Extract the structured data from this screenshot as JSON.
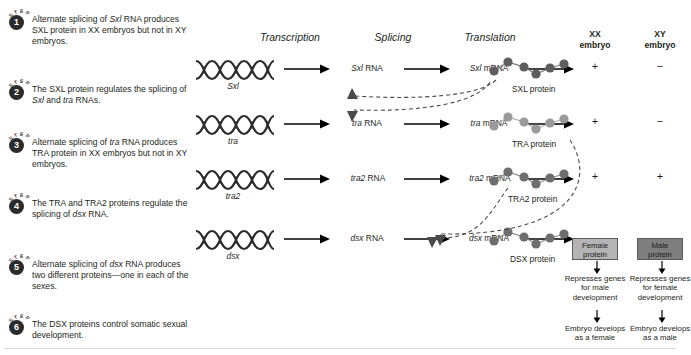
{
  "steps": [
    {
      "badge_word": "STEP",
      "number": "1",
      "text": "Alternate splicing of Sxl RNA produces SXL protein in XX embryos but not in XY embryos.",
      "italic_terms": [
        "Sxl"
      ]
    },
    {
      "badge_word": "STEP",
      "number": "2",
      "text": "The SXL protein regulates the splicing of Sxl and tra RNAs.",
      "italic_terms": [
        "Sxl",
        "tra"
      ]
    },
    {
      "badge_word": "STEP",
      "number": "3",
      "text": "Alternate splicing of tra RNA produces TRA protein in XX embryos but not in XY embryos.",
      "italic_terms": [
        "tra"
      ]
    },
    {
      "badge_word": "STEP",
      "number": "4",
      "text": "The TRA and TRA2 proteins regulate the splicing of dsx RNA.",
      "italic_terms": [
        "dsx"
      ]
    },
    {
      "badge_word": "STEP",
      "number": "5",
      "text": "Alternate splicing of dsx RNA produces two different proteins—one in each of the sexes.",
      "italic_terms": [
        "dsx"
      ]
    },
    {
      "badge_word": "STEP",
      "number": "6",
      "text": "The DSX proteins control somatic sexual development.",
      "italic_terms": []
    }
  ],
  "column_headers": {
    "transcription": "Transcription",
    "splicing": "Splicing",
    "translation": "Translation",
    "xx_embryo_line1": "XX",
    "xx_embryo_line2": "embryo",
    "xy_embryo_line1": "XY",
    "xy_embryo_line2": "embryo"
  },
  "rows": [
    {
      "gene": "Sxl",
      "rna": "Sxl RNA",
      "rna_italic": "Sxl",
      "rna_rest": " RNA",
      "mrna_italic": "Sxl",
      "mrna_rest": " mRNA",
      "protein_label": "SXL protein",
      "bead_color": "#5e5e5e",
      "xx": "+",
      "xy": "−"
    },
    {
      "gene": "tra",
      "rna": "tra RNA",
      "rna_italic": "tra",
      "rna_rest": " RNA",
      "mrna_italic": "tra",
      "mrna_rest": " mRNA",
      "protein_label": "TRA protein",
      "bead_color": "#9a9a9a",
      "xx": "+",
      "xy": "−"
    },
    {
      "gene": "tra2",
      "rna": "tra2 RNA",
      "rna_italic": "tra2",
      "rna_rest": " RNA",
      "mrna_italic": "tra2",
      "mrna_rest": " mRNA",
      "protein_label": "TRA2 protein",
      "bead_color": "#6e6e6e",
      "xx": "+",
      "xy": "+"
    },
    {
      "gene": "dsx",
      "rna": "dsx RNA",
      "rna_italic": "dsx",
      "rna_rest": " RNA",
      "mrna_italic": "dsx",
      "mrna_rest": " mRNA",
      "protein_label": "DSX protein",
      "bead_color": "#6e6e6e",
      "xx": "",
      "xy": ""
    }
  ],
  "outcomes": {
    "female": {
      "box_line1": "Female",
      "box_line2": "protein",
      "represses": "Represses genes for male development",
      "result": "Embryo develops as a female",
      "box_color": "#b4b4b4"
    },
    "male": {
      "box_line1": "Male",
      "box_line2": "protein",
      "represses": "Represses genes for female development",
      "result": "Embryo develops as a male",
      "box_color": "#7e7e7e"
    }
  },
  "colors": {
    "text": "#231f20",
    "badge": "#2b2b2b",
    "dashed_arrow": "#4a4a4a",
    "rule": "#d8d8d8"
  }
}
